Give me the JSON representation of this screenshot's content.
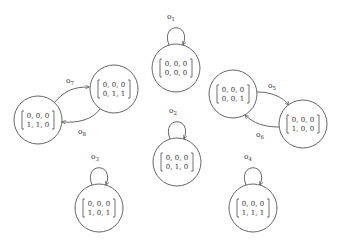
{
  "diagram": {
    "type": "state-transition-graph",
    "nodes": [
      {
        "id": "n000000",
        "row1": "0, 0, 0",
        "row2": "0, 0, 0",
        "cx": 176,
        "cy": 68
      },
      {
        "id": "n000011",
        "row1": "0, 0, 0",
        "row2": "0, 1, 1",
        "cx": 114,
        "cy": 89
      },
      {
        "id": "n000110",
        "row1": "0, 0, 0",
        "row2": "1, 1, 0",
        "cx": 38,
        "cy": 120
      },
      {
        "id": "n000001",
        "row1": "0, 0, 0",
        "row2": "0, 0, 1",
        "cx": 233,
        "cy": 94
      },
      {
        "id": "n000100",
        "row1": "0, 0, 0",
        "row2": "1, 0, 0",
        "cx": 303,
        "cy": 124
      },
      {
        "id": "n000010",
        "row1": "0, 0, 0",
        "row2": "0, 1, 0",
        "cx": 177,
        "cy": 162
      },
      {
        "id": "n000101",
        "row1": "0, 0, 0",
        "row2": "1, 0, 1",
        "cx": 99,
        "cy": 208
      },
      {
        "id": "n000111",
        "row1": "0, 0, 0",
        "row2": "1, 1, 1",
        "cx": 253,
        "cy": 208
      }
    ],
    "edges": [
      {
        "label": "o",
        "sub": "1",
        "from": "n000000",
        "to": "n000000",
        "kind": "self-loop"
      },
      {
        "label": "o",
        "sub": "2",
        "from": "n000010",
        "to": "n000010",
        "kind": "self-loop"
      },
      {
        "label": "o",
        "sub": "3",
        "from": "n000101",
        "to": "n000101",
        "kind": "self-loop"
      },
      {
        "label": "o",
        "sub": "4",
        "from": "n000111",
        "to": "n000111",
        "kind": "self-loop"
      },
      {
        "label": "o",
        "sub": "5",
        "from": "n000001",
        "to": "n000100",
        "kind": "arc"
      },
      {
        "label": "o",
        "sub": "6",
        "from": "n000100",
        "to": "n000001",
        "kind": "arc"
      },
      {
        "label": "o",
        "sub": "7",
        "from": "n000110",
        "to": "n000011",
        "kind": "arc"
      },
      {
        "label": "o",
        "sub": "8",
        "from": "n000011",
        "to": "n000110",
        "kind": "arc"
      }
    ]
  },
  "labels": {
    "o1": "o",
    "o1_sub": "1",
    "o2": "o",
    "o2_sub": "2",
    "o3": "o",
    "o3_sub": "3",
    "o4": "o",
    "o4_sub": "4",
    "o5": "o",
    "o5_sub": "5",
    "o6": "o",
    "o6_sub": "6",
    "o7": "o",
    "o7_sub": "7",
    "o8": "o",
    "o8_sub": "8"
  },
  "matrices": {
    "top_center": {
      "row1": "0, 0, 0",
      "row2": "0, 0, 0"
    },
    "left_upper": {
      "row1": "0, 0, 0",
      "row2": "0, 1, 1"
    },
    "left_lower": {
      "row1": "0, 0, 0",
      "row2": "1, 1, 0"
    },
    "right_upper": {
      "row1": "0, 0, 0",
      "row2": "0, 0, 1"
    },
    "right_lower": {
      "row1": "0, 0, 0",
      "row2": "1, 0, 0"
    },
    "middle": {
      "row1": "0, 0, 0",
      "row2": "0, 1, 0"
    },
    "bottom_left": {
      "row1": "0, 0, 0",
      "row2": "1, 0, 1"
    },
    "bottom_right": {
      "row1": "0, 0, 0",
      "row2": "1, 1, 1"
    }
  }
}
